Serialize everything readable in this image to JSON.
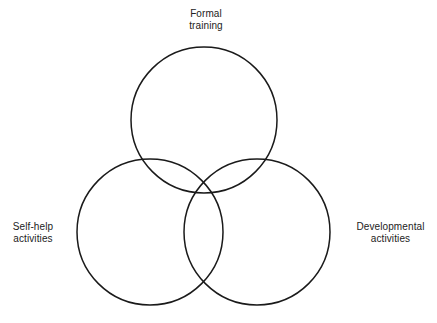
{
  "diagram": {
    "type": "venn-3-circle",
    "title": "",
    "background_color": "#ffffff",
    "stroke_color": "#1a1a1a",
    "stroke_width": 1.5,
    "fill": "none",
    "canvas": {
      "width": 437,
      "height": 323
    },
    "circles": [
      {
        "id": "formal-training",
        "cx": 204,
        "cy": 120,
        "r": 73,
        "label_position": "top"
      },
      {
        "id": "self-help-activities",
        "cx": 150,
        "cy": 232,
        "r": 73,
        "label_position": "left"
      },
      {
        "id": "developmental-activities",
        "cx": 257,
        "cy": 232,
        "r": 73,
        "label_position": "right"
      }
    ],
    "labels": {
      "formal_training": {
        "line1": "Formal",
        "line2": "training"
      },
      "self_help": {
        "line1": "Self-help",
        "line2": "activities"
      },
      "developmental": {
        "line1": "Developmental",
        "line2": "activities"
      }
    }
  }
}
